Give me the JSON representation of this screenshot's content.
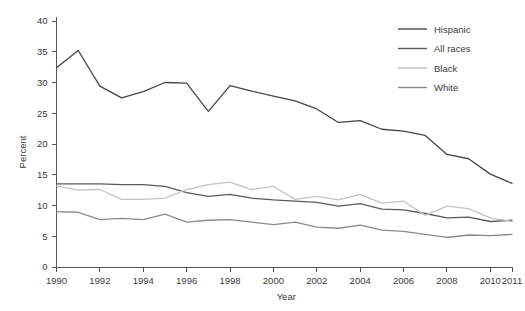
{
  "chart_data": {
    "type": "line",
    "title": "",
    "xlabel": "Year",
    "ylabel": "Percent",
    "xlim": [
      1990,
      2011
    ],
    "ylim": [
      0,
      40
    ],
    "xticks": [
      1990,
      1992,
      1994,
      1996,
      1998,
      2000,
      2002,
      2004,
      2006,
      2008,
      2010,
      2011
    ],
    "xtick_labels": [
      "1990",
      "1992",
      "1994",
      "1996",
      "1998",
      "2000",
      "2002",
      "2004",
      "2006",
      "2008",
      "2010",
      "2011"
    ],
    "yticks": [
      0,
      5,
      10,
      15,
      20,
      25,
      30,
      35,
      40
    ],
    "ytick_labels": [
      "0",
      "5",
      "10",
      "15",
      "20",
      "25",
      "30",
      "35",
      "40"
    ],
    "grid": false,
    "legend_position": "top-right",
    "x": [
      1990,
      1991,
      1992,
      1993,
      1994,
      1995,
      1996,
      1997,
      1998,
      1999,
      2000,
      2001,
      2002,
      2003,
      2004,
      2005,
      2006,
      2007,
      2008,
      2009,
      2010,
      2011
    ],
    "series": [
      {
        "name": "Hispanic",
        "color": "#454545",
        "values": [
          32.4,
          35.2,
          29.4,
          27.5,
          28.5,
          30.0,
          29.9,
          25.3,
          29.5,
          28.6,
          27.8,
          27.0,
          25.7,
          23.5,
          23.8,
          22.4,
          22.1,
          21.4,
          18.3,
          17.6,
          15.1,
          13.6
        ]
      },
      {
        "name": "All races",
        "color": "#5a5a5a",
        "values": [
          13.5,
          13.5,
          13.5,
          13.4,
          13.4,
          13.1,
          12.1,
          11.5,
          11.8,
          11.2,
          10.9,
          10.7,
          10.5,
          9.9,
          10.3,
          9.4,
          9.3,
          8.7,
          8.0,
          8.1,
          7.4,
          7.6
        ]
      },
      {
        "name": "Black",
        "color": "#c2c2c2",
        "values": [
          13.2,
          12.5,
          12.6,
          11.0,
          11.0,
          11.2,
          12.6,
          13.4,
          13.8,
          12.6,
          13.1,
          11.0,
          11.5,
          10.9,
          11.8,
          10.4,
          10.7,
          8.4,
          9.9,
          9.5,
          8.0,
          7.4
        ]
      },
      {
        "name": "White",
        "color": "#8a8a8a",
        "values": [
          9.0,
          8.9,
          7.7,
          7.9,
          7.7,
          8.6,
          7.3,
          7.6,
          7.7,
          7.3,
          6.9,
          7.3,
          6.5,
          6.3,
          6.8,
          6.0,
          5.8,
          5.3,
          4.8,
          5.2,
          5.1,
          5.3
        ]
      }
    ]
  },
  "legend": {
    "entries": [
      {
        "label": "Hispanic"
      },
      {
        "label": "All races"
      },
      {
        "label": "Black"
      },
      {
        "label": "White"
      }
    ]
  }
}
